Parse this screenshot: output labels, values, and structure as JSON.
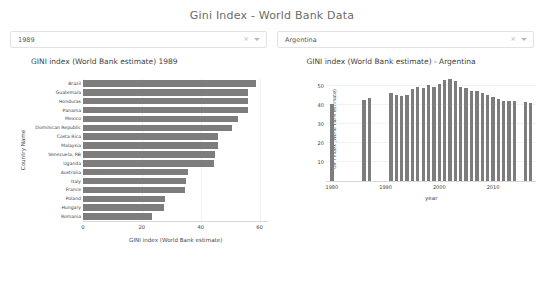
{
  "app": {
    "title": "Gini Index - World Bank Data"
  },
  "controls": {
    "year_select": {
      "name": "year-select",
      "value": "1989",
      "placeholder": "Select year",
      "clear_icon": "clear-icon",
      "caret_icon": "chevron-down-icon"
    },
    "country_select": {
      "name": "country-select",
      "value": "Argentina",
      "placeholder": "Select country",
      "clear_icon": "clear-icon",
      "caret_icon": "chevron-down-icon"
    }
  },
  "chart_data": [
    {
      "id": "gini-by-country-1989",
      "type": "bar",
      "orientation": "horizontal",
      "title": "GINI index (World Bank estimate) 1989",
      "xlabel": "GINI index (World Bank estimate)",
      "ylabel": "Country Name",
      "xlim": [
        0,
        63
      ],
      "xticks": [
        0,
        20,
        40,
        60
      ],
      "grid": false,
      "legend": "none",
      "bar_color": "#7d7d7d",
      "categories": [
        "Brazil",
        "Guatemala",
        "Honduras",
        "Panama",
        "Mexico",
        "Dominican Republic",
        "Costa Rica",
        "Malaysia",
        "Venezuela, RB",
        "Uganda",
        "Australia",
        "Italy",
        "France",
        "Poland",
        "Hungary",
        "Romania"
      ],
      "values": [
        58.6,
        56.0,
        56.0,
        56.0,
        52.5,
        50.5,
        46.0,
        46.0,
        44.9,
        44.4,
        35.5,
        35.0,
        34.6,
        28.0,
        27.5,
        23.3
      ]
    },
    {
      "id": "gini-timeseries-argentina",
      "type": "bar",
      "orientation": "vertical",
      "title": "GINI index (World Bank estimate) - Argentina",
      "xlabel": "year",
      "ylabel": "GINI index (World Bank estimate)",
      "ylim": [
        0,
        55
      ],
      "yticks": [
        10,
        20,
        30,
        40,
        50
      ],
      "xlim": [
        1979,
        2018
      ],
      "xticks": [
        1980,
        1990,
        2000,
        2010
      ],
      "grid": false,
      "legend": "none",
      "bar_color": "#7d7d7d",
      "x": [
        1980,
        1986,
        1987,
        1991,
        1992,
        1993,
        1994,
        1995,
        1996,
        1997,
        1998,
        1999,
        2000,
        2001,
        2002,
        2003,
        2004,
        2005,
        2006,
        2007,
        2008,
        2009,
        2010,
        2011,
        2012,
        2013,
        2014,
        2016,
        2017
      ],
      "values": [
        40.8,
        42.8,
        44.0,
        46.8,
        45.5,
        44.9,
        45.3,
        48.9,
        49.5,
        49.1,
        50.7,
        49.8,
        51.1,
        53.3,
        53.8,
        52.8,
        49.9,
        49.3,
        47.7,
        47.4,
        46.3,
        45.3,
        44.5,
        43.6,
        42.5,
        42.3,
        42.3,
        42.0,
        41.2
      ]
    }
  ]
}
